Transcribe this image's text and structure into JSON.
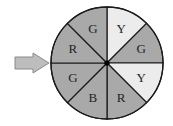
{
  "diagram": {
    "type": "spinner",
    "center": {
      "x": 107,
      "y": 63
    },
    "radius": 56,
    "colors": {
      "dark_sector": "#a9a9a9",
      "light_sector": "#ececec",
      "outline": "#1a1a1a",
      "hub": "#000000",
      "arrow_fill": "#bdbdbd",
      "arrow_stroke": "#8a8a8a"
    },
    "sectors": [
      {
        "label": "Y",
        "start_deg": 0,
        "end_deg": 45,
        "shade": "light"
      },
      {
        "label": "G",
        "start_deg": 45,
        "end_deg": 90,
        "shade": "dark"
      },
      {
        "label": "Y",
        "start_deg": 90,
        "end_deg": 135,
        "shade": "light"
      },
      {
        "label": "R",
        "start_deg": 135,
        "end_deg": 180,
        "shade": "dark"
      },
      {
        "label": "B",
        "start_deg": 180,
        "end_deg": 225,
        "shade": "dark"
      },
      {
        "label": "G",
        "start_deg": 225,
        "end_deg": 270,
        "shade": "dark"
      },
      {
        "label": "R",
        "start_deg": 270,
        "end_deg": 315,
        "shade": "dark"
      },
      {
        "label": "G",
        "start_deg": 315,
        "end_deg": 360,
        "shade": "dark"
      }
    ],
    "pointer": {
      "direction": "right",
      "points_at_deg": 270,
      "icon": "arrow-right-icon"
    }
  }
}
